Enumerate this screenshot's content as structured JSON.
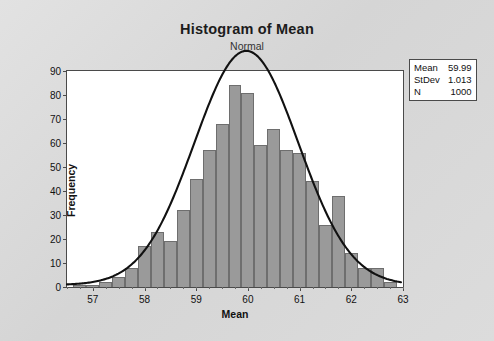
{
  "chart_data": {
    "type": "bar",
    "title": "Histogram of Mean",
    "subtitle": "Normal",
    "xlabel": "Mean",
    "ylabel": "Frequency",
    "xlim": [
      56.5,
      63.0
    ],
    "ylim": [
      0,
      90
    ],
    "grid": false,
    "bin_width": 0.25,
    "bar_color": "#9a9a9a",
    "bar_edge_color": "#6e6e6e",
    "curve_color": "#111111",
    "curve_label": "Normal density fit",
    "xticks": [
      "57",
      "58",
      "59",
      "60",
      "61",
      "62",
      "63"
    ],
    "yticks": [
      "0",
      "10",
      "20",
      "30",
      "40",
      "50",
      "60",
      "70",
      "80",
      "90"
    ],
    "x": [
      56.75,
      57.0,
      57.25,
      57.5,
      57.75,
      58.0,
      58.25,
      58.5,
      58.75,
      59.0,
      59.25,
      59.5,
      59.75,
      60.0,
      60.25,
      60.5,
      60.75,
      61.0,
      61.25,
      61.5,
      61.75,
      62.0,
      62.25,
      62.5,
      62.75
    ],
    "values": [
      1,
      1,
      2,
      4,
      8,
      17,
      23,
      19,
      32,
      45,
      57,
      68,
      84,
      81,
      59,
      66,
      57,
      56,
      44,
      26,
      38,
      14,
      8,
      8,
      2
    ],
    "legend": {
      "position": "outside-right-top",
      "rows": [
        {
          "label": "Mean",
          "value": "59.99"
        },
        {
          "label": "StDev",
          "value": "1.013"
        },
        {
          "label": "N",
          "value": "1000"
        }
      ]
    }
  }
}
